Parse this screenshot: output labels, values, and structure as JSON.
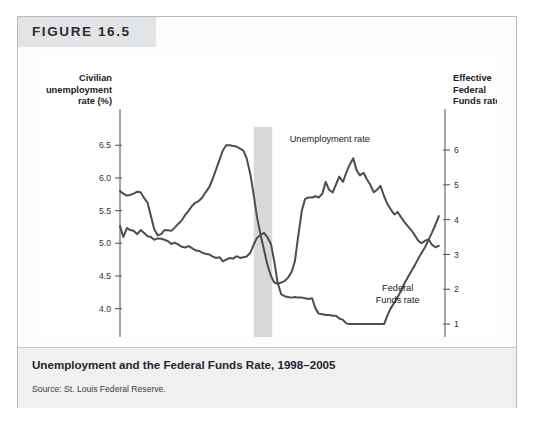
{
  "figure": {
    "number_label": "FIGURE 16.5",
    "caption": "Unemployment and the Federal Funds Rate, 1998–2005",
    "source": "Source: St. Louis Federal Reserve."
  },
  "colors": {
    "frame_border": "#b9bcc0",
    "title_band": "#e3e4e6",
    "caption_band": "#f0f0f1",
    "plot_background": "#ffffff",
    "line": "#4a4d52",
    "axis": "#5a5d62",
    "recession_band": "#d9d9d9"
  },
  "chart_data": {
    "type": "line",
    "title": "Unemployment and the Federal Funds Rate, 1998–2005",
    "xlabel": "Year",
    "grid": false,
    "legend": "inline-annotations",
    "x_ticks": [
      "1998",
      "1999",
      "2000",
      "2001",
      "2002",
      "2003",
      "2004",
      "2005"
    ],
    "x_tick_values": [
      1998,
      1999,
      2000,
      2001,
      2002,
      2003,
      2004,
      2005
    ],
    "xlim": [
      1998,
      2005.9
    ],
    "left_axis": {
      "label": "Civilian unemployment rate (%)",
      "ticks": [
        "6.5",
        "6.0",
        "5.5",
        "5.0",
        "4.5",
        "4.0"
      ],
      "tick_values": [
        6.5,
        6.0,
        5.5,
        5.0,
        4.5,
        4.0
      ],
      "ylim": [
        3.55,
        6.78
      ]
    },
    "right_axis": {
      "label": "Effective Federal Funds rate (%)",
      "ticks": [
        "6",
        "5",
        "4",
        "3",
        "2",
        "1"
      ],
      "tick_values": [
        6,
        5,
        4,
        3,
        2,
        1
      ],
      "ylim": [
        0.6,
        6.66
      ]
    },
    "annotations": [
      {
        "name": "unemployment-rate-label",
        "text": "Unemployment rate",
        "x": 2003.1,
        "y_left": 6.55
      },
      {
        "name": "federal-funds-rate-label",
        "text": "Federal\nFunds rate",
        "line1": "Federal",
        "line2": "Funds rate",
        "x": 2004.75,
        "y_right": 1.95
      },
      {
        "name": "year-axis-label",
        "text": "Year"
      }
    ],
    "shaded_region": {
      "name": "recession-band",
      "x_start": 2001.25,
      "x_end": 2001.7,
      "color": "#d9d9d9"
    },
    "series": [
      {
        "name": "Unemployment rate",
        "axis": "left",
        "unit": "%",
        "x": [
          1998.0,
          1998.08,
          1998.17,
          1998.25,
          1998.33,
          1998.42,
          1998.5,
          1998.58,
          1998.67,
          1998.75,
          1998.83,
          1998.92,
          1999.0,
          1999.08,
          1999.17,
          1999.25,
          1999.33,
          1999.42,
          1999.5,
          1999.58,
          1999.67,
          1999.75,
          1999.83,
          1999.92,
          2000.0,
          2000.08,
          2000.17,
          2000.25,
          2000.33,
          2000.42,
          2000.5,
          2000.58,
          2000.67,
          2000.75,
          2000.83,
          2000.92,
          2001.0,
          2001.08,
          2001.17,
          2001.25,
          2001.33,
          2001.42,
          2001.5,
          2001.58,
          2001.67,
          2001.75,
          2001.83,
          2001.92,
          2002.0,
          2002.08,
          2002.17,
          2002.25,
          2002.33,
          2002.42,
          2002.5,
          2002.58,
          2002.67,
          2002.75,
          2002.83,
          2002.92,
          2003.0,
          2003.08,
          2003.17,
          2003.25,
          2003.33,
          2003.42,
          2003.5,
          2003.58,
          2003.67,
          2003.75,
          2003.83,
          2003.92,
          2004.0,
          2004.08,
          2004.17,
          2004.25,
          2004.33,
          2004.42,
          2004.5,
          2004.58,
          2004.67,
          2004.75,
          2004.83,
          2004.92,
          2005.0,
          2005.08,
          2005.17,
          2005.25,
          2005.33,
          2005.42,
          2005.5,
          2005.58,
          2005.67,
          2005.75
        ],
        "y": [
          5.8,
          5.76,
          5.73,
          5.74,
          5.76,
          5.79,
          5.78,
          5.7,
          5.62,
          5.42,
          5.22,
          5.12,
          5.14,
          5.2,
          5.2,
          5.19,
          5.24,
          5.3,
          5.35,
          5.43,
          5.5,
          5.57,
          5.62,
          5.65,
          5.7,
          5.78,
          5.86,
          5.98,
          6.12,
          6.28,
          6.42,
          6.5,
          6.5,
          6.49,
          6.48,
          6.45,
          6.42,
          6.3,
          6.05,
          5.74,
          5.4,
          5.12,
          4.9,
          4.68,
          4.5,
          4.4,
          4.38,
          4.4,
          4.42,
          4.47,
          4.56,
          4.72,
          5.1,
          5.5,
          5.68,
          5.7,
          5.7,
          5.72,
          5.7,
          5.76,
          5.94,
          5.82,
          5.78,
          5.9,
          6.02,
          5.94,
          6.08,
          6.2,
          6.3,
          6.12,
          6.04,
          6.08,
          5.98,
          5.9,
          5.78,
          5.82,
          5.88,
          5.72,
          5.6,
          5.52,
          5.44,
          5.48,
          5.4,
          5.32,
          5.26,
          5.2,
          5.12,
          5.04,
          5.0,
          5.04,
          5.06,
          4.98,
          4.94,
          4.96
        ],
        "left_axis_values": true
      },
      {
        "name": "Federal Funds rate",
        "axis": "right",
        "unit": "%",
        "x": [
          1998.0,
          1998.08,
          1998.17,
          1998.25,
          1998.33,
          1998.42,
          1998.5,
          1998.58,
          1998.67,
          1998.75,
          1998.83,
          1998.92,
          1999.0,
          1999.08,
          1999.17,
          1999.25,
          1999.33,
          1999.42,
          1999.5,
          1999.58,
          1999.67,
          1999.75,
          1999.83,
          1999.92,
          2000.0,
          2000.08,
          2000.17,
          2000.25,
          2000.33,
          2000.42,
          2000.5,
          2000.58,
          2000.67,
          2000.75,
          2000.83,
          2000.92,
          2001.0,
          2001.08,
          2001.17,
          2001.25,
          2001.33,
          2001.42,
          2001.5,
          2001.58,
          2001.67,
          2001.75,
          2001.83,
          2001.92,
          2002.0,
          2002.08,
          2002.17,
          2002.25,
          2002.33,
          2002.42,
          2002.5,
          2002.58,
          2002.67,
          2002.75,
          2002.83,
          2002.92,
          2003.0,
          2003.08,
          2003.17,
          2003.25,
          2003.33,
          2003.42,
          2003.5,
          2003.58,
          2003.67,
          2003.75,
          2003.83,
          2003.92,
          2004.0,
          2004.08,
          2004.17,
          2004.25,
          2004.33,
          2004.42,
          2004.5,
          2004.58,
          2004.67,
          2004.75,
          2004.83,
          2004.92,
          2005.0,
          2005.08,
          2005.17,
          2005.25,
          2005.33,
          2005.42,
          2005.5,
          2005.58,
          2005.67,
          2005.75
        ],
        "y": [
          3.82,
          3.5,
          3.76,
          3.7,
          3.68,
          3.58,
          3.7,
          3.62,
          3.52,
          3.5,
          3.42,
          3.46,
          3.45,
          3.42,
          3.38,
          3.3,
          3.34,
          3.28,
          3.22,
          3.2,
          3.24,
          3.18,
          3.12,
          3.1,
          3.05,
          3.02,
          3.0,
          2.94,
          2.9,
          2.92,
          2.8,
          2.85,
          2.9,
          2.88,
          2.95,
          2.9,
          2.92,
          2.94,
          3.05,
          3.28,
          3.48,
          3.56,
          3.62,
          3.5,
          3.3,
          2.8,
          2.2,
          1.85,
          1.8,
          1.78,
          1.76,
          1.78,
          1.76,
          1.76,
          1.74,
          1.72,
          1.74,
          1.45,
          1.3,
          1.28,
          1.26,
          1.26,
          1.24,
          1.24,
          1.16,
          1.12,
          1.02,
          1.0,
          1.0,
          1.0,
          1.0,
          1.0,
          1.0,
          1.0,
          1.0,
          1.0,
          1.0,
          1.0,
          1.25,
          1.45,
          1.62,
          1.78,
          1.95,
          2.18,
          2.35,
          2.52,
          2.7,
          2.88,
          3.04,
          3.22,
          3.42,
          3.62,
          3.86,
          4.1
        ],
        "right_axis_values": true
      }
    ]
  }
}
